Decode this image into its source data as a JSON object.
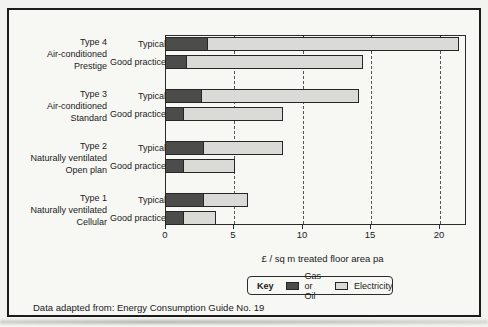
{
  "chart_data": {
    "type": "bar",
    "orientation": "horizontal",
    "stacked": true,
    "xlabel": "£ / sq m treated floor area pa",
    "xlim": [
      0,
      22
    ],
    "xticks": [
      0,
      5,
      10,
      15,
      20
    ],
    "gridlines": "vertical dashed at 5, 10, 15, 20",
    "series_names": [
      "Gas or Oil",
      "Electricity"
    ],
    "groups": [
      {
        "label_lines": [
          "Type 4",
          "Air-conditioned",
          "Prestige"
        ],
        "bars": [
          {
            "label": "Typical",
            "gas_or_oil": 3.1,
            "electricity": 18.4,
            "total": 21.5
          },
          {
            "label": "Good practice",
            "gas_or_oil": 1.5,
            "electricity": 13.0,
            "total": 14.5
          }
        ]
      },
      {
        "label_lines": [
          "Type 3",
          "Air-conditioned",
          "Standard"
        ],
        "bars": [
          {
            "label": "Typical",
            "gas_or_oil": 2.6,
            "electricity": 11.6,
            "total": 14.2
          },
          {
            "label": "Good practice",
            "gas_or_oil": 1.3,
            "electricity": 7.3,
            "total": 8.6
          }
        ]
      },
      {
        "label_lines": [
          "Type 2",
          "Naturally ventilated",
          "Open plan"
        ],
        "bars": [
          {
            "label": "Typical",
            "gas_or_oil": 2.8,
            "electricity": 5.8,
            "total": 8.6
          },
          {
            "label": "Good practice",
            "gas_or_oil": 1.3,
            "electricity": 3.8,
            "total": 5.1
          }
        ]
      },
      {
        "label_lines": [
          "Type 1",
          "Naturally ventilated",
          "Cellular"
        ],
        "bars": [
          {
            "label": "Typical",
            "gas_or_oil": 2.8,
            "electricity": 3.3,
            "total": 6.1
          },
          {
            "label": "Good practice",
            "gas_or_oil": 1.3,
            "electricity": 2.4,
            "total": 3.7
          }
        ]
      }
    ]
  },
  "legend": {
    "title": "Key",
    "items": [
      {
        "label": "Gas or Oil",
        "color": "#4c4c4a"
      },
      {
        "label": "Electricity",
        "color": "#dadad6"
      }
    ],
    "position": "below chart"
  },
  "source_note": "Data adapted from: Energy Consumption Guide No. 19",
  "colors": {
    "gas_or_oil": "#4c4c4a",
    "electricity": "#dadad6",
    "bar_border": "#262626",
    "plot_border": "#2b2b2b",
    "frame_border": "#1c1c1c",
    "background": "#f7f7f4",
    "gridline": "#565656",
    "text": "#1a1a1a"
  }
}
